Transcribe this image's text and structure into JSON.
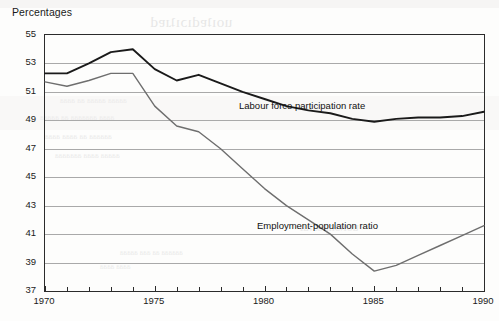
{
  "chart_data": {
    "type": "line",
    "title": "Percentages",
    "xlabel": "",
    "ylabel": "",
    "ylim": [
      37,
      55
    ],
    "xlim": [
      1970,
      1990
    ],
    "grid": true,
    "legend_position": "inline-annotations",
    "yticks": [
      37,
      39,
      41,
      43,
      45,
      47,
      49,
      51,
      53,
      55
    ],
    "xticks": [
      1970,
      1975,
      1980,
      1985,
      1990
    ],
    "xtick_all_years": [
      1970,
      1971,
      1972,
      1973,
      1974,
      1975,
      1976,
      1977,
      1978,
      1979,
      1980,
      1981,
      1982,
      1983,
      1984,
      1985,
      1986,
      1987,
      1988,
      1989,
      1990
    ],
    "x": [
      1970,
      1971,
      1972,
      1973,
      1974,
      1975,
      1976,
      1977,
      1978,
      1979,
      1980,
      1981,
      1982,
      1983,
      1984,
      1985,
      1986,
      1987,
      1988,
      1989,
      1990
    ],
    "series": [
      {
        "name": "Labour force participation rate",
        "color": "#1a1a1a",
        "width": 1.9,
        "values": [
          52.3,
          52.3,
          53.0,
          53.8,
          54.0,
          52.6,
          51.8,
          52.2,
          51.6,
          51.0,
          50.5,
          50.0,
          49.7,
          49.5,
          49.1,
          48.9,
          49.1,
          49.2,
          49.2,
          49.3,
          49.6
        ]
      },
      {
        "name": "Employment-population ratio",
        "color": "#6e6e6e",
        "width": 1.4,
        "values": [
          51.7,
          51.4,
          51.8,
          52.3,
          52.3,
          50.0,
          48.6,
          48.2,
          47.0,
          45.6,
          44.2,
          43.0,
          42.0,
          41.0,
          39.6,
          38.4,
          38.8,
          39.5,
          40.2,
          40.9,
          41.6
        ]
      }
    ],
    "annotations": [
      {
        "id": "lfpr",
        "text": "Labour force participation rate"
      },
      {
        "id": "epr",
        "text": "Employment-population ratio"
      }
    ]
  },
  "background_artifacts": {
    "note": "faint reverse-page show-through, not real content",
    "title_ghost": "uoıʇɐdıɔıʇɹɐd",
    "line_a": "aaaaa aaaaa aa aaaa",
    "line_b": "aaaa aaaaaaa aa aaaaa",
    "line_c": "aaaaaa aa aaaa aaaa",
    "line_d": "aaaaa aaaa aaaaaaa",
    "ghost_heading": "uoıʇɔnpoɹʇuı",
    "line_e": "aaaa aaaaa aa aaaaa aaaa",
    "line_f": "aaaaaa aa aaa aaaaa",
    "line_g": "aaaa aaaa"
  }
}
